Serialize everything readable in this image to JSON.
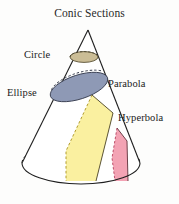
{
  "figure": {
    "title": "Conic Sections",
    "labels": {
      "circle": "Circle",
      "ellipse": "Ellipse",
      "parabola": "Parabola",
      "hyperbola": "Hyperbola"
    },
    "colors": {
      "circle_fill": "#cbbd96",
      "ellipse_fill": "#8e99b5",
      "parabola_fill": "#faf0a0",
      "hyperbola_fill": "#f3a3b4",
      "outline": "#1f1f1f",
      "background": "#fdfdfc",
      "text": "#1b1b1b"
    },
    "geometry": {
      "apex": "88,30",
      "base_center": "81,163",
      "base_rx": "59",
      "base_ry": "21",
      "left_edge_base": "22,163",
      "right_edge_base": "140,163"
    }
  }
}
